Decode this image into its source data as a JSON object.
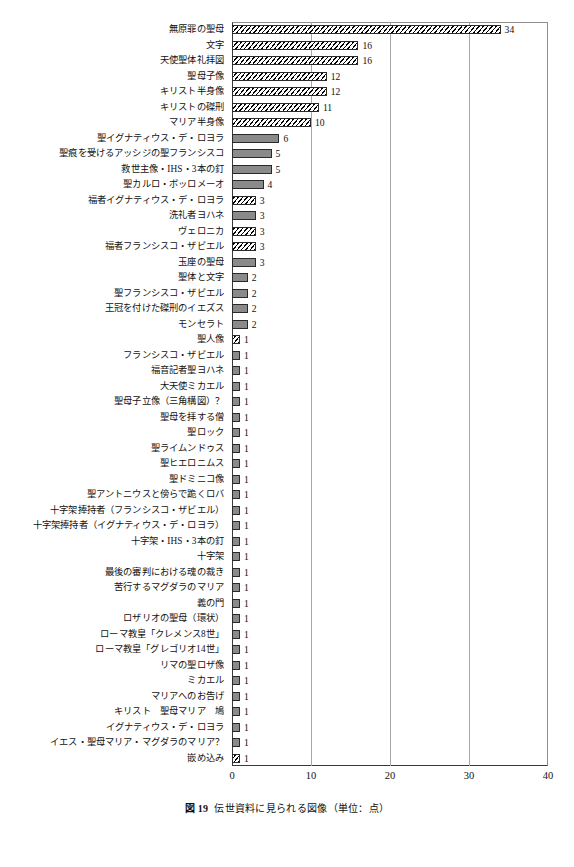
{
  "caption": {
    "number": "図 19",
    "text": "伝世資料に見られる図像（単位：点）"
  },
  "chart_data": {
    "type": "bar",
    "orientation": "horizontal",
    "title": "伝世資料に見られる図像（単位：点）",
    "xlabel": "",
    "ylabel": "",
    "xlim": [
      0,
      40
    ],
    "xticks": [
      "0",
      "10",
      "20",
      "30",
      "40"
    ],
    "grid": true,
    "legend": "none",
    "colors": {
      "bar_fill": "#8a8a8a",
      "bar_edge": "#2a2a2a",
      "hatch_fill": "#ffffff",
      "hatch_line": "#000000",
      "gridline": "#a7a7a7",
      "axis": "#3a3a3a"
    },
    "categories": [
      "無原罪の聖母",
      "文字",
      "天使聖体礼拝図",
      "聖母子像",
      "キリスト半身像",
      "キリストの磔刑",
      "マリア半身像",
      "聖イグナティウス・デ・ロヨラ",
      "聖痕を受けるアッシジの聖フランシスコ",
      "救世主像・IHS・3本の釘",
      "聖カルロ・ボッロメーオ",
      "福者イグナティウス・デ・ロヨラ",
      "洗礼者ヨハネ",
      "ヴェロニカ",
      "福者フランシスコ・ザビエル",
      "玉座の聖母",
      "聖体と文字",
      "聖フランシスコ・ザビエル",
      "王冠を付けた磔刑のイエズス",
      "モンセラト",
      "聖人像",
      "フランシスコ・ザビエル",
      "福音記者聖ヨハネ",
      "大天使ミカエル",
      "聖母子立像（三角構図）？",
      "聖母を拝する僧",
      "聖ロック",
      "聖ライムンドゥス",
      "聖ヒエロニムス",
      "聖ドミニコ像",
      "聖アントニウスと傍らで跪くロバ",
      "十字架捧持者（フランシスコ・ザビエル）",
      "十字架捧持者（イグナティウス・デ・ロヨラ）",
      "十字架・IHS・3本の釘",
      "十字架",
      "最後の審判における魂の裁き",
      "苦行するマグダラのマリア",
      "義の門",
      "ロザリオの聖母（環状）",
      "ローマ教皇「クレメンス8世」",
      "ローマ教皇「グレゴリオ14世」",
      "リマの聖ロザ像",
      "ミカエル",
      "マリアへのお告げ",
      "キリスト　聖母マリア　鳩",
      "イグナティウス・デ・ロヨラ",
      "イエス・聖母マリア・マグダラのマリア？",
      "嵌め込み"
    ],
    "values": [
      34,
      16,
      16,
      12,
      12,
      11,
      10,
      6,
      5,
      5,
      4,
      3,
      3,
      3,
      3,
      3,
      2,
      2,
      2,
      2,
      1,
      1,
      1,
      1,
      1,
      1,
      1,
      1,
      1,
      1,
      1,
      1,
      1,
      1,
      1,
      1,
      1,
      1,
      1,
      1,
      1,
      1,
      1,
      1,
      1,
      1,
      1,
      1
    ],
    "patterns": [
      "hatch",
      "hatch",
      "hatch",
      "hatch",
      "hatch",
      "hatch",
      "hatch",
      "solid",
      "solid",
      "solid",
      "solid",
      "hatch",
      "solid",
      "hatch",
      "hatch",
      "solid",
      "solid",
      "solid",
      "solid",
      "solid",
      "hatch",
      "solid",
      "solid",
      "solid",
      "solid",
      "solid",
      "solid",
      "solid",
      "solid",
      "solid",
      "solid",
      "solid",
      "solid",
      "solid",
      "solid",
      "solid",
      "solid",
      "solid",
      "solid",
      "solid",
      "solid",
      "solid",
      "solid",
      "solid",
      "solid",
      "solid",
      "solid",
      "hatch"
    ]
  }
}
